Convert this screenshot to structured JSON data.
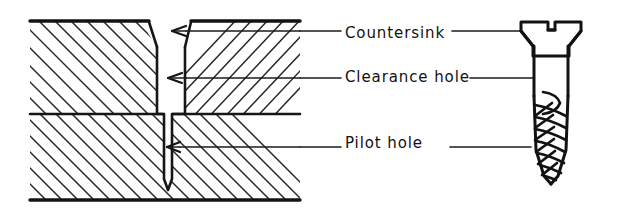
{
  "figure": {
    "kind": "technical-line-drawing",
    "ink_color": "#131313",
    "background_color": "#ffffff"
  },
  "labels": [
    {
      "id": "countersink",
      "text": "Countersink",
      "points_to_section": "chamfered top of clearance hole",
      "points_to_screw": "flat countersunk head"
    },
    {
      "id": "clearance_hole",
      "text": "Clearance hole",
      "points_to_section": "straight bore through upper workpiece",
      "points_to_screw": "unthreaded shank"
    },
    {
      "id": "pilot_hole",
      "text": "Pilot hole",
      "points_to_section": "narrow bore in lower workpiece",
      "points_to_screw": "threaded tapered portion"
    }
  ],
  "section_view": {
    "upper_workpiece": {
      "hatch_direction": "backslash"
    },
    "upper_right_workpiece": {
      "hatch_direction": "slash"
    },
    "lower_workpiece": {
      "hatch_direction": "backslash"
    },
    "joint_line_y": 114,
    "features": [
      {
        "name": "countersink",
        "shape": "conical chamfer"
      },
      {
        "name": "clearance-hole",
        "shape": "straight cylindrical bore"
      },
      {
        "name": "pilot-hole",
        "shape": "narrow bore with V drill point"
      }
    ]
  },
  "screw": {
    "head_type": "flat countersunk slotted head",
    "shank": "plain cylindrical",
    "thread": "coarse helical thread tapering to a point"
  }
}
